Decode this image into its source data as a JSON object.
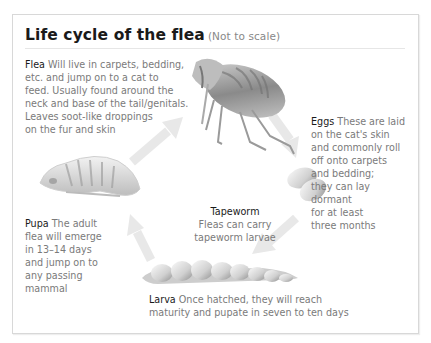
{
  "title": "Life cycle of the flea",
  "subtitle": "(Not to scale)",
  "stages": {
    "flea": {
      "label": "Flea",
      "text": "Will live in carpets, bedding,\netc. and jump on to a cat to\nfeed. Usually found around the\nneck and base of the tail/genitals.\nLeaves soot-like droppings\non the fur and skin"
    },
    "eggs": {
      "label": "Eggs",
      "text": "These are laid\non the cat's skin\nand commonly roll\noff onto carpets\n      and bedding;\n        they can lay\n        dormant\n          for at least\n      three months"
    },
    "larva": {
      "label": "Larva",
      "text": "Once hatched, they will reach\nmaturity and pupate in seven to ten days"
    },
    "pupa": {
      "label": "Pupa",
      "text": "The adult\nflea will emerge\nin 13–14 days\nand jump on to\nany passing\nmammal"
    },
    "tapeworm": {
      "label": "Tapeworm",
      "text": "Fleas can carry\ntapeworm larvae"
    }
  },
  "colors": {
    "arrow": "#e6e6e6",
    "heading": "#1a1a1a",
    "body_text": "#7a7a7a",
    "frame": "#d8d8d8"
  }
}
